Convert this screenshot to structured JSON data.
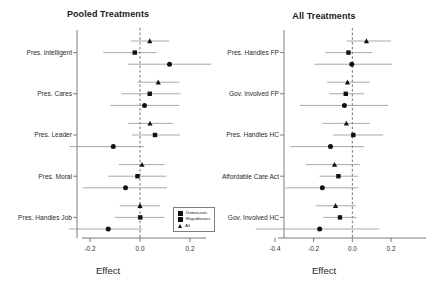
{
  "figure": {
    "width": 432,
    "height": 293,
    "background": "#ffffff",
    "series_colors": {
      "point": "#111111",
      "interval": "#9a9a9a",
      "zero_line": "#555555",
      "axis": "#6e6e6e"
    }
  },
  "legend": {
    "position": "bottom-right of left panel",
    "items": [
      {
        "label": "Democrats",
        "marker": "circle"
      },
      {
        "label": "Republicans",
        "marker": "square"
      },
      {
        "label": "All",
        "marker": "triangle"
      }
    ]
  },
  "chart_data": [
    {
      "type": "scatter",
      "title": "Pooled Treatments",
      "xlabel": "Effect",
      "ylabel": "",
      "xlim": [
        -0.285,
        0.285
      ],
      "xticks": [
        -0.2,
        0.0,
        0.2
      ],
      "xticklabels": [
        "-0.2",
        "0.0",
        "0.2"
      ],
      "grid": false,
      "zero_reference_line": 0.0,
      "categories": [
        "Pres. Intelligent",
        "Pres. Cares",
        "Pres. Leader",
        "Pres. Moral",
        "Pres. Handles Job"
      ],
      "legend_position": "lower right",
      "series": [
        {
          "name": "Democrats",
          "marker": "circle",
          "values": [
            0.118,
            0.018,
            -0.107,
            -0.058,
            -0.127
          ],
          "ci_low": [
            -0.047,
            -0.118,
            -0.283,
            -0.228,
            -0.285
          ],
          "ci_high": [
            0.285,
            0.158,
            0.015,
            0.108,
            0.01
          ]
        },
        {
          "name": "Republicans",
          "marker": "square",
          "values": [
            -0.021,
            0.039,
            0.06,
            -0.01,
            0.001
          ],
          "ci_low": [
            -0.147,
            -0.075,
            -0.032,
            -0.128,
            -0.101
          ],
          "ci_high": [
            0.066,
            0.162,
            0.16,
            0.105,
            0.098
          ]
        },
        {
          "name": "All",
          "marker": "triangle",
          "values": [
            0.039,
            0.073,
            0.04,
            0.008,
            0.0
          ],
          "ci_low": [
            -0.035,
            -0.01,
            -0.048,
            -0.085,
            -0.081
          ],
          "ci_high": [
            0.117,
            0.158,
            0.132,
            0.098,
            0.08
          ]
        }
      ]
    },
    {
      "type": "scatter",
      "title": "All Treatments",
      "xlabel": "Effect",
      "ylabel": "",
      "xlim": [
        -0.5,
        0.28
      ],
      "xticks": [
        -0.4,
        -0.2,
        0.0,
        0.2
      ],
      "xticklabels": [
        "-0.4",
        "-0.2",
        "0.0",
        "0.2"
      ],
      "grid": false,
      "zero_reference_line": 0.0,
      "categories": [
        "Pres. Handles FP",
        "Gov. Involved FP",
        "Pres. Handles HC",
        "Affordable Care Act",
        "Gov. Involved HC"
      ],
      "legend_position": "none",
      "series": [
        {
          "name": "Democrats",
          "marker": "circle",
          "values": [
            -0.003,
            -0.041,
            -0.113,
            -0.155,
            -0.169
          ],
          "ci_low": [
            -0.198,
            -0.27,
            -0.32,
            -0.345,
            -0.5
          ],
          "ci_high": [
            0.205,
            0.185,
            0.06,
            0.03,
            0.14
          ]
        },
        {
          "name": "Republicans",
          "marker": "square",
          "values": [
            -0.02,
            -0.034,
            0.005,
            -0.072,
            -0.064
          ],
          "ci_low": [
            -0.14,
            -0.12,
            -0.1,
            -0.17,
            -0.15
          ],
          "ci_high": [
            0.102,
            0.06,
            0.16,
            0.03,
            0.022
          ]
        },
        {
          "name": "All",
          "marker": "triangle",
          "values": [
            0.073,
            -0.025,
            -0.031,
            -0.092,
            -0.087
          ],
          "ci_low": [
            -0.03,
            -0.13,
            -0.155,
            -0.24,
            -0.19
          ],
          "ci_high": [
            0.2,
            0.09,
            0.09,
            0.04,
            0.02
          ]
        }
      ]
    }
  ]
}
